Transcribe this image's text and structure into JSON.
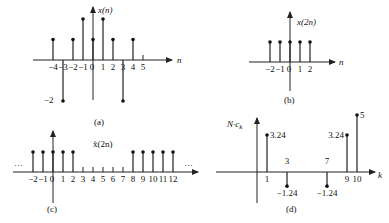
{
  "panels": {
    "a": {
      "caption": "(a)",
      "ylabel": "x(n)",
      "xlabel": "n",
      "ticks": [
        "−4",
        "−3",
        "−2",
        "−1",
        "0",
        "1",
        "2",
        "3",
        "4",
        "5"
      ],
      "ylevel_label": "−2"
    },
    "b": {
      "caption": "(b)",
      "ylabel": "x(2n)",
      "xlabel": "n",
      "ticks": [
        "−2",
        "−1",
        "0",
        "1",
        "2"
      ]
    },
    "c": {
      "caption": "(c)",
      "ylabel": "x̃(2n)",
      "ellipsis": "…",
      "ticks": [
        "−2",
        "−1",
        "0",
        "1",
        "2",
        "3",
        "4",
        "5",
        "6",
        "7",
        "8",
        "9",
        "10",
        "11",
        "12"
      ]
    },
    "d": {
      "caption": "(d)",
      "ylabel": "N·c",
      "ylabel_sub": "k",
      "xlabel": "k",
      "ticks": [
        "1",
        "3",
        "7",
        "9",
        "10"
      ],
      "value_labels": [
        "3.24",
        "−1.24",
        "−1.24",
        "3.24",
        "5"
      ]
    }
  },
  "chart_data": [
    {
      "type": "stem",
      "title": "(a)",
      "ylabel": "x(n)",
      "xlabel": "n",
      "x": [
        -4,
        -3,
        -2,
        -1,
        0,
        1,
        2,
        3,
        4,
        5
      ],
      "values": [
        1,
        -2,
        1,
        2,
        1,
        2,
        1,
        -2,
        1,
        0
      ]
    },
    {
      "type": "stem",
      "title": "(b)",
      "ylabel": "x(2n)",
      "xlabel": "n",
      "x": [
        -2,
        -1,
        0,
        1,
        2
      ],
      "values": [
        1,
        1,
        1,
        1,
        1
      ]
    },
    {
      "type": "stem",
      "title": "(c)",
      "ylabel": "x̃(2n)",
      "xlabel": "n",
      "x": [
        -2,
        -1,
        0,
        1,
        2,
        3,
        4,
        5,
        6,
        7,
        8,
        9,
        10,
        11,
        12
      ],
      "values": [
        1,
        1,
        1,
        1,
        1,
        0,
        0,
        0,
        0,
        0,
        1,
        1,
        1,
        1,
        1
      ],
      "periodic": true
    },
    {
      "type": "stem",
      "title": "(d)",
      "ylabel": "N·c_k",
      "xlabel": "k",
      "x": [
        1,
        3,
        7,
        9,
        10
      ],
      "values": [
        3.24,
        -1.24,
        -1.24,
        3.24,
        5
      ]
    }
  ]
}
